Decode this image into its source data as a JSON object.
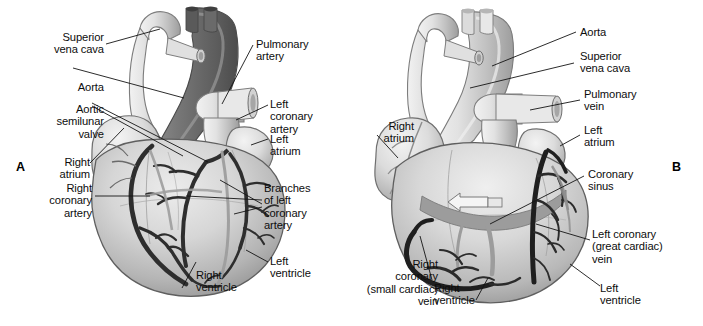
{
  "figure": {
    "background_color": "#ffffff",
    "text_color": "#0d0d0d",
    "panels": [
      {
        "id": "A",
        "id_label": "A",
        "view": "anterior view showing coronary arteries",
        "labels": [
          {
            "name": "superior-vena-cava",
            "text": "Superior\nvena cava",
            "align": "right"
          },
          {
            "name": "aorta",
            "text": "Aorta",
            "align": "right"
          },
          {
            "name": "aortic-semilunar-valve",
            "text": "Aortic\nsemilunar\nvalve",
            "align": "right"
          },
          {
            "name": "right-atrium",
            "text": "Right\natrium",
            "align": "right"
          },
          {
            "name": "right-coronary-artery",
            "text": "Right\ncoronary\nartery",
            "align": "right"
          },
          {
            "name": "right-ventricle",
            "text": "Right\nventricle",
            "align": "left"
          },
          {
            "name": "pulmonary-artery",
            "text": "Pulmonary\nartery",
            "align": "left"
          },
          {
            "name": "left-coronary-artery",
            "text": "Left\ncoronary\nartery",
            "align": "left"
          },
          {
            "name": "left-atrium",
            "text": "Left\natrium",
            "align": "left"
          },
          {
            "name": "branches-of-left-coronary-artery",
            "text": "Branches\nof left\ncoronary\nartery",
            "align": "left"
          },
          {
            "name": "left-ventricle",
            "text": "Left\nventricle",
            "align": "left"
          }
        ]
      },
      {
        "id": "B",
        "id_label": "B",
        "view": "posterior view showing cardiac veins",
        "labels": [
          {
            "name": "aorta",
            "text": "Aorta",
            "align": "left"
          },
          {
            "name": "superior-vena-cava",
            "text": "Superior\nvena cava",
            "align": "left"
          },
          {
            "name": "pulmonary-vein",
            "text": "Pulmonary\nvein",
            "align": "left"
          },
          {
            "name": "left-atrium",
            "text": "Left\natrium",
            "align": "left"
          },
          {
            "name": "right-atrium",
            "text": "Right\natrium",
            "align": "right"
          },
          {
            "name": "coronary-sinus",
            "text": "Coronary\nsinus",
            "align": "left"
          },
          {
            "name": "left-coronary-great-cardiac-vein",
            "text": "Left coronary\n(great cardiac)\nvein",
            "align": "left"
          },
          {
            "name": "right-coronary-small-cardiac-vein",
            "text": "Right\ncoronary\n(small cardiac)\nvein",
            "align": "right"
          },
          {
            "name": "right-ventricle",
            "text": "Right\nventricle",
            "align": "left"
          },
          {
            "name": "left-ventricle",
            "text": "Left\nventricle",
            "align": "left"
          }
        ]
      }
    ],
    "colors": {
      "heart_light": "#d9d9d9",
      "heart_mid": "#bdbdbd",
      "heart_dark": "#8c8c8c",
      "aorta_dark": "#6e6e6e",
      "vessel_black": "#2b2b2b",
      "vessel_gray": "#9a9a9a",
      "outline": "#3a3a3a",
      "leader_line": "#1a1a1a"
    }
  }
}
